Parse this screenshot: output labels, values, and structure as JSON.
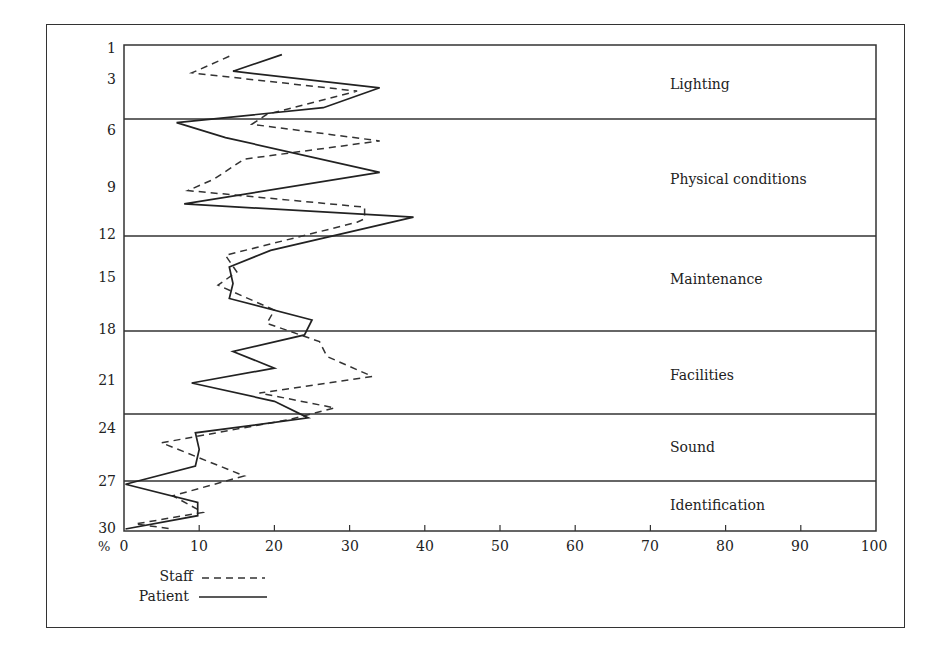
{
  "chart_data": {
    "type": "line",
    "orientation": "horizontal-profile",
    "title": "",
    "xlabel": "%",
    "ylabel": "",
    "xlim": [
      0,
      100
    ],
    "ylim": [
      1,
      30
    ],
    "x_ticks": [
      0,
      10,
      20,
      30,
      40,
      50,
      60,
      70,
      80,
      90,
      100
    ],
    "y_tick_labels": [
      "1",
      "3",
      "6",
      "9",
      "12",
      "15",
      "18",
      "21",
      "24",
      "27",
      "30"
    ],
    "grid": false,
    "legend_position": "bottom-left",
    "categories": [
      {
        "label": "Lighting",
        "items": [
          1,
          5
        ]
      },
      {
        "label": "Physical conditions",
        "items": [
          6,
          12
        ]
      },
      {
        "label": "Maintenance",
        "items": [
          12,
          18
        ]
      },
      {
        "label": "Facilities",
        "items": [
          18,
          23
        ]
      },
      {
        "label": "Sound",
        "items": [
          23,
          27
        ]
      },
      {
        "label": "Identification",
        "items": [
          27,
          30
        ]
      }
    ],
    "series": [
      {
        "name": "Staff",
        "style": "dashed",
        "points": [
          [
            14,
            1.5
          ],
          [
            9,
            2.5
          ],
          [
            31,
            3.6
          ],
          [
            19,
            5.0
          ],
          [
            17,
            5.6
          ],
          [
            34,
            6.6
          ],
          [
            16,
            7.7
          ],
          [
            12,
            8.9
          ],
          [
            8.5,
            9.6
          ],
          [
            32,
            10.6
          ],
          [
            32,
            11.3
          ],
          [
            31,
            11.5
          ],
          [
            13.5,
            13.5
          ],
          [
            15,
            14.5
          ],
          [
            12.5,
            15.3
          ],
          [
            20,
            16.8
          ],
          [
            19,
            17.6
          ],
          [
            26,
            18.7
          ],
          [
            27,
            19.6
          ],
          [
            33,
            20.8
          ],
          [
            18,
            21.8
          ],
          [
            28,
            22.7
          ],
          [
            22,
            23.4
          ],
          [
            5,
            24.8
          ],
          [
            16,
            26.8
          ],
          [
            6.5,
            28.0
          ],
          [
            10.5,
            29.0
          ],
          [
            1.5,
            29.7
          ],
          [
            6.5,
            30.0
          ]
        ]
      },
      {
        "name": "Patient",
        "style": "solid",
        "points": [
          [
            21,
            1.4
          ],
          [
            14.5,
            2.4
          ],
          [
            34,
            3.4
          ],
          [
            26.5,
            4.6
          ],
          [
            7,
            5.5
          ],
          [
            13.5,
            6.4
          ],
          [
            34,
            8.5
          ],
          [
            8,
            10.4
          ],
          [
            38.5,
            11.2
          ],
          [
            19.5,
            13.2
          ],
          [
            14,
            14.2
          ],
          [
            14.5,
            15.2
          ],
          [
            14,
            16.1
          ],
          [
            25,
            17.4
          ],
          [
            24,
            18.3
          ],
          [
            14.5,
            19.3
          ],
          [
            20,
            20.3
          ],
          [
            9,
            21.2
          ],
          [
            20,
            22.3
          ],
          [
            24.5,
            23.3
          ],
          [
            9.5,
            24.2
          ],
          [
            10,
            25.2
          ],
          [
            9.5,
            26.2
          ],
          [
            0.2,
            27.3
          ],
          [
            9.8,
            28.4
          ],
          [
            9.8,
            29.2
          ],
          [
            0.2,
            30.0
          ]
        ]
      }
    ]
  },
  "axis": {
    "y_labels": [
      "1",
      "3",
      "6",
      "9",
      "12",
      "15",
      "18",
      "21",
      "24",
      "27",
      "30"
    ],
    "x_labels": [
      "0",
      "10",
      "20",
      "30",
      "40",
      "50",
      "60",
      "70",
      "80",
      "90",
      "100"
    ],
    "x_unit": "%"
  },
  "categories": [
    "Lighting",
    "Physical conditions",
    "Maintenance",
    "Facilities",
    "Sound",
    "Identification"
  ],
  "legend": {
    "staff": "Staff",
    "patient": "Patient"
  }
}
